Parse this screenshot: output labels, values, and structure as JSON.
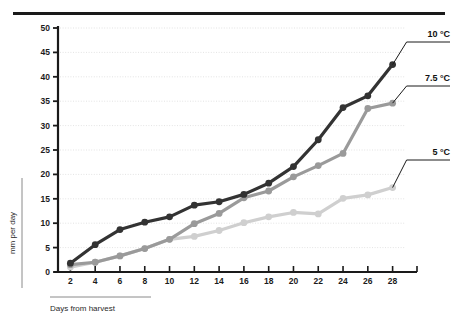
{
  "figure": {
    "top_rule": true,
    "clipped_header_text": ""
  },
  "chart_data": {
    "type": "line",
    "title": "",
    "subtitle": "",
    "xlabel": "Days from harvest",
    "ylabel": "mm per day",
    "x": [
      2,
      4,
      6,
      8,
      10,
      12,
      14,
      16,
      18,
      20,
      22,
      24,
      26,
      28
    ],
    "xticks": [
      "2",
      "4",
      "6",
      "8",
      "10",
      "12",
      "14",
      "16",
      "18",
      "20",
      "22",
      "24",
      "26",
      "28"
    ],
    "yticks": [
      "0",
      "5",
      "10",
      "15",
      "20",
      "25",
      "30",
      "35",
      "40",
      "45",
      "50"
    ],
    "xlim": [
      1,
      29
    ],
    "ylim": [
      0,
      50
    ],
    "grid": true,
    "grid_style": "dotted-horizontal",
    "legend_position": "right-annotation-labels",
    "series": [
      {
        "name": "10 °C",
        "label": "10 °C",
        "color": "#333333",
        "marker": "circle",
        "values": [
          1.8,
          5.6,
          8.7,
          10.2,
          11.3,
          13.7,
          14.4,
          15.9,
          18.2,
          21.6,
          27.1,
          33.7,
          36.1,
          42.5
        ]
      },
      {
        "name": "7.5 °C",
        "label": "7.5 °C",
        "color": "#9a9a9a",
        "marker": "circle",
        "values": [
          1.5,
          2.0,
          3.3,
          4.8,
          6.7,
          9.9,
          12.0,
          15.2,
          16.6,
          19.5,
          21.8,
          24.3,
          33.5,
          34.6
        ]
      },
      {
        "name": "5 °C",
        "label": "5 °C",
        "color": "#cfcfcf",
        "marker": "circle",
        "values": [
          1.0,
          2.0,
          3.3,
          4.8,
          6.7,
          7.3,
          8.5,
          10.1,
          11.3,
          12.2,
          11.9,
          15.1,
          15.8,
          17.3
        ]
      }
    ],
    "annotations": [
      {
        "text": "10 °C",
        "anchor_x": 28,
        "anchor_y": 42.5
      },
      {
        "text": "7.5 °C",
        "anchor_x": 28,
        "anchor_y": 34.6
      },
      {
        "text": "5 °C",
        "anchor_x": 28,
        "anchor_y": 17.3
      }
    ]
  },
  "colors": {
    "series_10c": "#333333",
    "series_75c": "#9a9a9a",
    "series_5c": "#cfcfcf",
    "axis": "#1a1a1a",
    "grid": "#dcdcdc",
    "background": "#ffffff"
  }
}
